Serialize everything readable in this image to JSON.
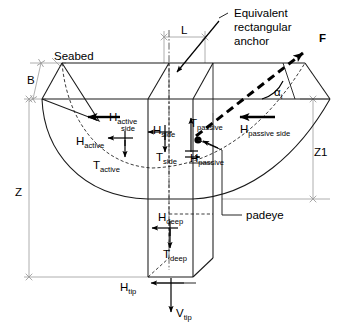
{
  "figure": {
    "type": "engineering-diagram",
    "background_color": "#ffffff",
    "line_color": "#1a1a1a",
    "dimension_line_color": "#9a9a9a"
  },
  "annotations": {
    "seabed": "Seabed",
    "equivalent_anchor_line1": "Equivalent",
    "equivalent_anchor_line2": "rectangular",
    "equivalent_anchor_line3": "anchor",
    "padeye": "padeye",
    "force_F": "F",
    "angle_alpha": "α",
    "angle_alpha_sub": "i"
  },
  "dimensions": {
    "L": "L",
    "B": "B",
    "Z": "Z",
    "Z1": "Z1"
  },
  "forces": [
    {
      "id": "h-active-side",
      "base": "H",
      "sub": "active",
      "sub2": "side",
      "direction": "left"
    },
    {
      "id": "h-active",
      "base": "H",
      "sub": "active",
      "direction": "left"
    },
    {
      "id": "t-active",
      "base": "T",
      "sub": "active",
      "direction": "down"
    },
    {
      "id": "h-side",
      "base": "H",
      "sub": "side",
      "direction": "left"
    },
    {
      "id": "t-side",
      "base": "T",
      "sub": "side",
      "direction": "down"
    },
    {
      "id": "t-passive",
      "base": "T",
      "sub": "passive",
      "direction": "up"
    },
    {
      "id": "h-passive-side",
      "base": "H",
      "sub": "passive side",
      "direction": "left"
    },
    {
      "id": "h-passive",
      "base": "H",
      "sub": "passive",
      "direction": "left"
    },
    {
      "id": "h-deep",
      "base": "H",
      "sub": "deep",
      "direction": "left"
    },
    {
      "id": "t-deep",
      "base": "T",
      "sub": "deep",
      "direction": "down"
    },
    {
      "id": "h-tip",
      "base": "H",
      "sub": "tip",
      "direction": "left"
    },
    {
      "id": "v-tip",
      "base": "V",
      "sub": "tip",
      "direction": "down"
    }
  ]
}
